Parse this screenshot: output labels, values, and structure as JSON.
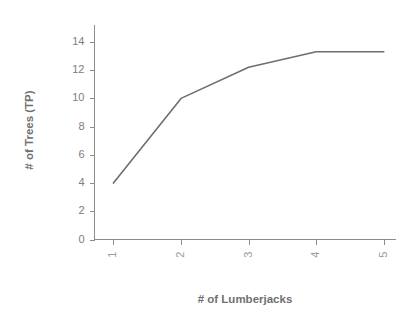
{
  "chart_data": {
    "type": "line",
    "title": "",
    "subtitle": "",
    "xlabel": "# of Lumberjacks",
    "ylabel": "# of Trees (TP)",
    "x": [
      1,
      2,
      3,
      4,
      5
    ],
    "values": [
      4.0,
      10.0,
      12.2,
      13.3,
      13.3
    ],
    "series": [
      {
        "name": "# of Trees (TP)",
        "values": [
          4.0,
          10.0,
          12.2,
          13.3,
          13.3
        ],
        "color": "#6e6e6e"
      }
    ],
    "xlim": [
      0.72,
      5.18
    ],
    "ylim": [
      0,
      15.2
    ],
    "xticks": [
      1,
      2,
      3,
      4,
      5
    ],
    "xtick_labels": [
      "1",
      "2",
      "3",
      "4",
      "5"
    ],
    "xtick_rotation": 90,
    "yticks": [
      0,
      2,
      4,
      6,
      8,
      10,
      12,
      14
    ],
    "ytick_labels": [
      "0",
      "2",
      "4",
      "6",
      "8",
      "10",
      "12",
      "14"
    ],
    "grid": false,
    "legend": false,
    "legend_position": "none",
    "annotations": [],
    "colors": {
      "line": "#6e6e6e",
      "axis": "#8c8c8c",
      "tick_label": "#7d7d7d",
      "axis_title": "#707070",
      "background": "#ffffff"
    }
  },
  "axes": {
    "x_title": "# of Lumberjacks",
    "y_title": "# of Trees (TP)"
  }
}
